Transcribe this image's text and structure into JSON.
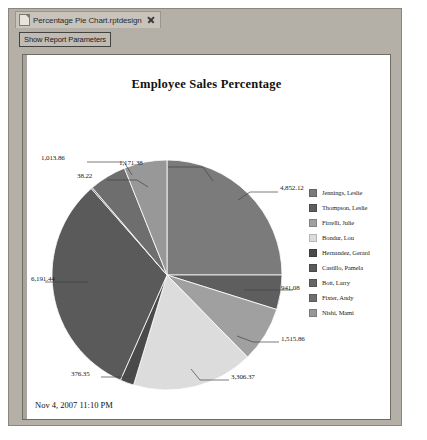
{
  "window": {
    "tab": {
      "label": "Percentage Pie Chart.rptdesign",
      "file_icon": "file-icon",
      "close_icon": "close-icon"
    },
    "toolbar": {
      "show_report_parameters_label": "Show Report Parameters"
    }
  },
  "report": {
    "footer_timestamp": "Nov 4, 2007 11:10 PM"
  },
  "chart_data": {
    "type": "pie",
    "title": "Employee Sales Percentage",
    "xlabel": "",
    "ylabel": "",
    "legend_position": "right",
    "grid": false,
    "categories": [
      "Jennings, Leslie",
      "Thompson, Leslie",
      "Firrelli, Julie",
      "Bondur, Lou",
      "Hernandez, Gerard",
      "Castillo, Pamela",
      "Bott, Larry",
      "Fixter, Andy",
      "Nishi, Mami"
    ],
    "values": [
      4852.12,
      941.08,
      1515.86,
      3306.37,
      376.35,
      6191.44,
      38.22,
      1013.86,
      1171.38
    ],
    "data_labels": [
      "4,852.12",
      "941.08",
      "1,515.86",
      "3,306.37",
      "376.35",
      "6,191.44",
      "38.22",
      "1,013.86",
      "1,171.38"
    ],
    "colors": [
      "#7b7b7b",
      "#5e5e5e",
      "#a0a0a0",
      "#dcdcdc",
      "#4a4a4a",
      "#5a5a5a",
      "#666666",
      "#6e6e6e",
      "#989898"
    ]
  }
}
